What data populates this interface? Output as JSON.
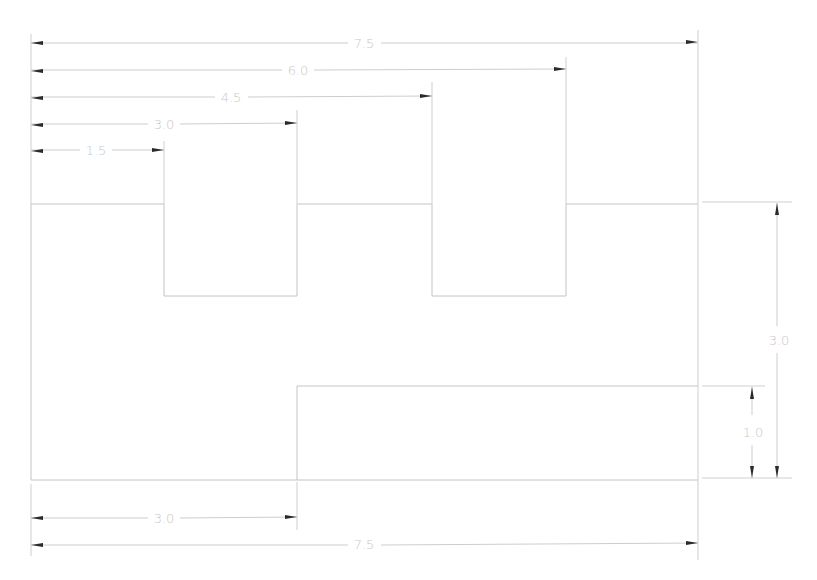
{
  "drawing": {
    "type": "2D dimensioned profile (CAD)",
    "units": "unitless",
    "colors": {
      "geometry": "#c4c4c4",
      "dimension_line": "#cdcdcd",
      "arrowhead": "#2a2a2a",
      "dimension_text": "#c8c8c8",
      "background": "#ffffff"
    },
    "profile": {
      "overall_width": "7.5",
      "overall_height": "3.0",
      "notches": [
        {
          "from": "1.5",
          "to": "3.0"
        },
        {
          "from": "4.5",
          "to": "6.0"
        }
      ],
      "step_height": "1.0",
      "step_start": "3.0"
    },
    "top_dimensions": [
      {
        "label": "7.5",
        "name": "overall-width-top"
      },
      {
        "label": "6.0",
        "name": "notch2-end"
      },
      {
        "label": "4.5",
        "name": "notch2-start"
      },
      {
        "label": "3.0",
        "name": "notch1-end"
      },
      {
        "label": "1.5",
        "name": "notch1-start"
      }
    ],
    "bottom_dimensions": [
      {
        "label": "3.0",
        "name": "step-start"
      },
      {
        "label": "7.5",
        "name": "overall-width-bottom"
      }
    ],
    "right_dimensions": [
      {
        "label": "3.0",
        "name": "overall-height"
      },
      {
        "label": "1.0",
        "name": "step-height"
      }
    ]
  }
}
